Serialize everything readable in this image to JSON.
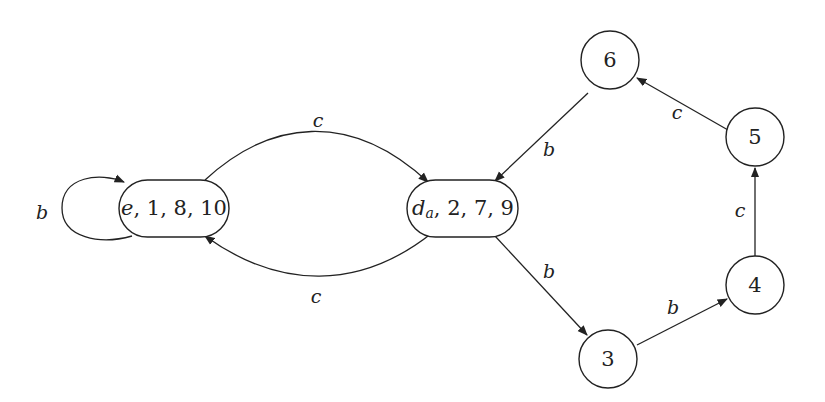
{
  "diagram": {
    "type": "state-transition-graph",
    "nodes": [
      {
        "id": "e",
        "label": "e, 1, 8, 10",
        "shape": "rounded-rect"
      },
      {
        "id": "d",
        "label": "d",
        "subscript": "a",
        "label_rest": ", 2, 7, 9",
        "shape": "rounded-rect"
      },
      {
        "id": "n3",
        "label": "3",
        "shape": "circle"
      },
      {
        "id": "n4",
        "label": "4",
        "shape": "circle"
      },
      {
        "id": "n5",
        "label": "5",
        "shape": "circle"
      },
      {
        "id": "n6",
        "label": "6",
        "shape": "circle"
      }
    ],
    "edges": [
      {
        "from": "e",
        "to": "e",
        "label": "b"
      },
      {
        "from": "e",
        "to": "d",
        "label": "c"
      },
      {
        "from": "d",
        "to": "e",
        "label": "c"
      },
      {
        "from": "n6",
        "to": "d",
        "label": "b"
      },
      {
        "from": "d",
        "to": "n3",
        "label": "b"
      },
      {
        "from": "n3",
        "to": "n4",
        "label": "b"
      },
      {
        "from": "n4",
        "to": "n5",
        "label": "c"
      },
      {
        "from": "n5",
        "to": "n6",
        "label": "c"
      }
    ]
  }
}
